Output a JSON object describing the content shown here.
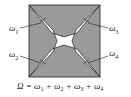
{
  "diagram": {
    "colors": {
      "fill": "#9a9a9a",
      "cross": "#ffffff",
      "stroke": "#222222"
    },
    "labels": [
      {
        "symbol": "ω",
        "sub": "1"
      },
      {
        "symbol": "ω",
        "sub": "2"
      },
      {
        "symbol": "ω",
        "sub": "3"
      },
      {
        "symbol": "ω",
        "sub": "4"
      }
    ],
    "formula": {
      "lhs": "Ω",
      "eq": " = ",
      "terms": [
        {
          "symbol": "ω",
          "sub": "1"
        },
        {
          "symbol": "ω",
          "sub": "2"
        },
        {
          "symbol": "ω",
          "sub": "3"
        },
        {
          "symbol": "ω",
          "sub": "4"
        }
      ],
      "plus": " + "
    }
  }
}
